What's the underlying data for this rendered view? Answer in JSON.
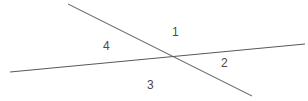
{
  "figure": {
    "background_color": "#ffffff",
    "width": 308,
    "height": 101,
    "line_color": "#58585a",
    "line_width": 1,
    "label_color": "#4a4a4a"
  },
  "labels": {
    "angle_1": "1",
    "angle_2": "2",
    "angle_3": "3",
    "angle_4": "4"
  },
  "chart_data": {
    "type": "diagram",
    "title": "",
    "xlabel": "",
    "ylabel": "",
    "xlim": [
      0,
      308
    ],
    "ylim": [
      0,
      101
    ],
    "grid": false,
    "legend": "none",
    "lines": [
      {
        "name": "shallow-line",
        "x1": 10,
        "y1": 72,
        "x2": 305,
        "y2": 44,
        "color": "#58585a",
        "width": 1
      },
      {
        "name": "steep-line",
        "x1": 68,
        "y1": 4,
        "x2": 252,
        "y2": 96,
        "color": "#58585a",
        "width": 1
      }
    ],
    "intersection": {
      "x": 172,
      "y": 57
    },
    "angle_labels": [
      {
        "text": "1",
        "x": 176,
        "y": 32,
        "region": "top"
      },
      {
        "text": "2",
        "x": 225,
        "y": 63,
        "region": "right"
      },
      {
        "text": "3",
        "x": 151,
        "y": 85,
        "region": "bottom"
      },
      {
        "text": "4",
        "x": 107,
        "y": 46,
        "region": "left"
      }
    ]
  }
}
